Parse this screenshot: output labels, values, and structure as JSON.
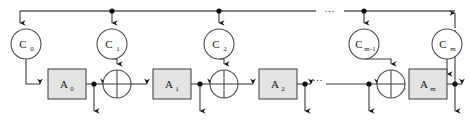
{
  "figure": {
    "width": 470,
    "height": 121,
    "background_color": "#ffffff",
    "line_color": "#3a3a3a",
    "bus_color": "#5a5a5a",
    "box_fill_color": "#e3e3e3",
    "circle_fill_color": "#ffffff"
  },
  "key_nodes": [
    {
      "id": "c0",
      "base": "C",
      "sub": "0",
      "label": "C0",
      "cx": 26,
      "cy": 44,
      "r": 15
    },
    {
      "id": "c1",
      "base": "C",
      "sub": "1",
      "label": "C1",
      "cx": 112,
      "cy": 44,
      "r": 15
    },
    {
      "id": "c2",
      "base": "C",
      "sub": "2",
      "label": "C2",
      "cx": 219,
      "cy": 44,
      "r": 15
    },
    {
      "id": "cm1",
      "base": "C",
      "sub": "m-1",
      "label": "Cm-1",
      "cx": 364,
      "cy": 44,
      "r": 15
    },
    {
      "id": "cm",
      "base": "C",
      "sub": "m",
      "label": "Cm",
      "cx": 447,
      "cy": 44,
      "r": 15
    }
  ],
  "transform_boxes": [
    {
      "id": "a0",
      "base": "A",
      "sub": "0",
      "label": "A0",
      "x": 48,
      "y": 69,
      "w": 38,
      "h": 30
    },
    {
      "id": "a1",
      "base": "A",
      "sub": "1",
      "label": "A1",
      "x": 153,
      "y": 69,
      "w": 38,
      "h": 30
    },
    {
      "id": "a2",
      "base": "A",
      "sub": "2",
      "label": "A2",
      "x": 259,
      "y": 69,
      "w": 38,
      "h": 30
    },
    {
      "id": "am",
      "base": "A",
      "sub": "m",
      "label": "Am",
      "x": 409,
      "y": 69,
      "w": 38,
      "h": 30
    }
  ],
  "xor_gates": [
    {
      "id": "xor1",
      "cx": 117,
      "cy": 84,
      "r": 14
    },
    {
      "id": "xor2",
      "cx": 224,
      "cy": 84,
      "r": 14
    },
    {
      "id": "xor3",
      "cx": 391,
      "cy": 84,
      "r": 14
    }
  ],
  "junction_dots": [
    {
      "id": "bus-dot-c1",
      "cx": 112,
      "cy": 11,
      "r": 2.6
    },
    {
      "id": "bus-dot-c2",
      "cx": 219,
      "cy": 11,
      "r": 2.6
    },
    {
      "id": "bus-dot-cm1",
      "cx": 364,
      "cy": 11,
      "r": 2.6
    },
    {
      "id": "tap-dot-a0",
      "cx": 94,
      "cy": 84,
      "r": 2.6
    },
    {
      "id": "tap-dot-a1",
      "cx": 200,
      "cy": 84,
      "r": 2.6
    },
    {
      "id": "tap-dot-a2",
      "cx": 305,
      "cy": 84,
      "r": 2.6
    },
    {
      "id": "tap-dot-xm",
      "cx": 369,
      "cy": 84,
      "r": 2.6
    },
    {
      "id": "tap-dot-am",
      "cx": 455,
      "cy": 84,
      "r": 2.6
    }
  ],
  "ellipses": [
    {
      "id": "bus-ellipsis",
      "text": "...",
      "x": 330,
      "y": 10
    },
    {
      "id": "data-ellipsis",
      "text": "...",
      "x": 318,
      "y": 80
    }
  ],
  "bus": {
    "label": "key-distribution-bus",
    "y": 11,
    "x_start": 20,
    "x_end": 455,
    "gap_start": 316,
    "gap_end": 344
  },
  "data_path": {
    "label": "data-path",
    "y": 84
  }
}
